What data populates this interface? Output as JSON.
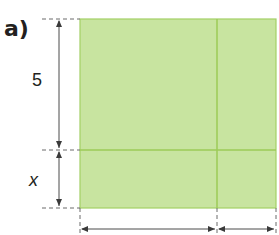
{
  "header": {
    "part_label": "a)"
  },
  "diagram": {
    "labels": {
      "vertical_top": "5",
      "vertical_bottom": "x",
      "horizontal_left": "",
      "horizontal_right": ""
    },
    "colors": {
      "fill": "#c8e4a0",
      "border": "#a3d065",
      "divider": "#9ccb57",
      "dimension_line": "#4a4a4a",
      "dashed_line": "#6b6b6b",
      "text": "#231f20"
    },
    "regions": [
      {
        "name": "top-left",
        "row": "5",
        "col": "left"
      },
      {
        "name": "top-right",
        "row": "5",
        "col": "right"
      },
      {
        "name": "bottom-left",
        "row": "x",
        "col": "left"
      },
      {
        "name": "bottom-right",
        "row": "x",
        "col": "right"
      }
    ]
  }
}
